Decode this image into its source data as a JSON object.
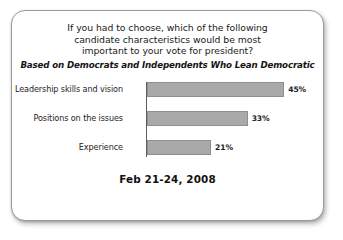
{
  "card": {
    "headline_lines": [
      "If you had to choose, which of the following",
      "candidate characteristics would be most",
      "important to your vote for president?"
    ],
    "subhead": "Based on Democrats and Independents Who Lean Democratic",
    "footer_date": "Feb 21-24, 2008",
    "bar_color": "#a9a9a9",
    "axis_color": "#5d5d5d",
    "border_color": "#9a9a9a",
    "text_color": "#1a1a1a"
  },
  "chart_data": {
    "type": "bar",
    "orientation": "horizontal",
    "title": "If you had to choose, which of the following candidate characteristics would be most important to your vote for president?",
    "subtitle": "Based on Democrats and Independents Who Lean Democratic",
    "categories": [
      "Leadership skills and vision",
      "Positions on the issues",
      "Experience"
    ],
    "values": [
      45,
      33,
      21
    ],
    "value_labels": [
      "45%",
      "33%",
      "21%"
    ],
    "xlabel": "",
    "ylabel": "",
    "xlim": [
      0,
      50
    ],
    "grid": false,
    "legend": false,
    "annotation": "Feb 21-24, 2008"
  }
}
